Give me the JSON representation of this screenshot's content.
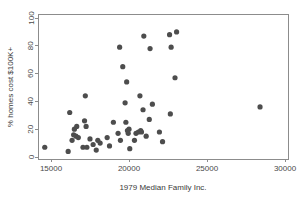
{
  "chart_data": {
    "type": "scatter",
    "title": "",
    "xlabel": "1979 Median Family Inc.",
    "ylabel": "% homes cost $100K+",
    "xlim": [
      14000,
      30600
    ],
    "ylim": [
      -3,
      101
    ],
    "grid": false,
    "legend": "none",
    "xticks": [
      "15000",
      "20000",
      "25000",
      "30000"
    ],
    "xtick_values": [
      15000,
      20000,
      25000,
      30000
    ],
    "yticks": [
      "0",
      "20",
      "40",
      "60",
      "80",
      "100"
    ],
    "ytick_values": [
      0,
      20,
      40,
      60,
      80,
      100
    ],
    "marker": {
      "shape": "circle",
      "color": "#4d4d4d",
      "radius_px": 2.6
    },
    "points": [
      {
        "x": 14600,
        "y": 7
      },
      {
        "x": 16100,
        "y": 4
      },
      {
        "x": 16200,
        "y": 32
      },
      {
        "x": 16350,
        "y": 12
      },
      {
        "x": 16450,
        "y": 16
      },
      {
        "x": 16500,
        "y": 20
      },
      {
        "x": 16600,
        "y": 15
      },
      {
        "x": 16650,
        "y": 22
      },
      {
        "x": 16750,
        "y": 14
      },
      {
        "x": 17050,
        "y": 7
      },
      {
        "x": 17150,
        "y": 26
      },
      {
        "x": 17200,
        "y": 44
      },
      {
        "x": 17250,
        "y": 22
      },
      {
        "x": 17300,
        "y": 7
      },
      {
        "x": 17500,
        "y": 13
      },
      {
        "x": 17700,
        "y": 9
      },
      {
        "x": 17900,
        "y": 5
      },
      {
        "x": 18000,
        "y": 12
      },
      {
        "x": 18150,
        "y": 10
      },
      {
        "x": 18600,
        "y": 14
      },
      {
        "x": 18750,
        "y": 8
      },
      {
        "x": 19000,
        "y": 25
      },
      {
        "x": 19300,
        "y": 17
      },
      {
        "x": 19400,
        "y": 79
      },
      {
        "x": 19450,
        "y": 12
      },
      {
        "x": 19600,
        "y": 65
      },
      {
        "x": 19750,
        "y": 39
      },
      {
        "x": 19800,
        "y": 25
      },
      {
        "x": 19850,
        "y": 54
      },
      {
        "x": 19900,
        "y": 19
      },
      {
        "x": 19950,
        "y": 17
      },
      {
        "x": 20000,
        "y": 20
      },
      {
        "x": 20050,
        "y": 6
      },
      {
        "x": 20350,
        "y": 12
      },
      {
        "x": 20450,
        "y": 17
      },
      {
        "x": 20600,
        "y": 18
      },
      {
        "x": 20700,
        "y": 44
      },
      {
        "x": 20750,
        "y": 19
      },
      {
        "x": 20800,
        "y": 18
      },
      {
        "x": 20900,
        "y": 34
      },
      {
        "x": 20950,
        "y": 87
      },
      {
        "x": 21100,
        "y": 15
      },
      {
        "x": 21300,
        "y": 27
      },
      {
        "x": 21350,
        "y": 78
      },
      {
        "x": 21500,
        "y": 38
      },
      {
        "x": 21950,
        "y": 18
      },
      {
        "x": 22150,
        "y": 11
      },
      {
        "x": 22600,
        "y": 88
      },
      {
        "x": 22650,
        "y": 31
      },
      {
        "x": 22700,
        "y": 79
      },
      {
        "x": 22950,
        "y": 57
      },
      {
        "x": 23050,
        "y": 90
      },
      {
        "x": 28400,
        "y": 36
      }
    ]
  },
  "axes": {
    "xlabel": "1979 Median Family Inc.",
    "ylabel": "% homes cost $100K+"
  }
}
